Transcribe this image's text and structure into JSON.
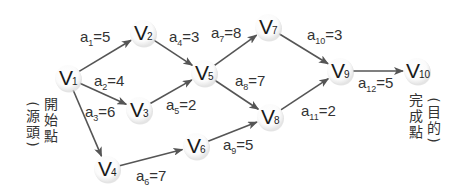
{
  "diagram": {
    "type": "activity-on-edge network (AOE)",
    "nodes": [
      {
        "id": "v1",
        "letter": "V",
        "sub": "1",
        "x": 68,
        "y": 78
      },
      {
        "id": "v2",
        "letter": "V",
        "sub": "2",
        "x": 143,
        "y": 33
      },
      {
        "id": "v3",
        "letter": "V",
        "sub": "3",
        "x": 139,
        "y": 110
      },
      {
        "id": "v4",
        "letter": "V",
        "sub": "4",
        "x": 107,
        "y": 169
      },
      {
        "id": "v5",
        "letter": "V",
        "sub": "5",
        "x": 204,
        "y": 73
      },
      {
        "id": "v6",
        "letter": "V",
        "sub": "6",
        "x": 196,
        "y": 146
      },
      {
        "id": "v7",
        "letter": "V",
        "sub": "7",
        "x": 268,
        "y": 27
      },
      {
        "id": "v8",
        "letter": "V",
        "sub": "8",
        "x": 270,
        "y": 117
      },
      {
        "id": "v9",
        "letter": "V",
        "sub": "9",
        "x": 340,
        "y": 71
      },
      {
        "id": "v10",
        "letter": "V",
        "sub": "10",
        "x": 417,
        "y": 71
      }
    ],
    "edges": [
      {
        "id": "a1",
        "from": "v1",
        "to": "v2",
        "name": "a",
        "sub": "1",
        "value": "=5",
        "lx": 80,
        "ly": 42
      },
      {
        "id": "a2",
        "from": "v1",
        "to": "v3",
        "name": "a",
        "sub": "2",
        "value": "=4",
        "lx": 94,
        "ly": 86
      },
      {
        "id": "a3",
        "from": "v1",
        "to": "v4",
        "name": "a",
        "sub": "3",
        "value": "=6",
        "lx": 85,
        "ly": 117
      },
      {
        "id": "a4",
        "from": "v2",
        "to": "v5",
        "name": "a",
        "sub": "4",
        "value": "=3",
        "lx": 169,
        "ly": 42
      },
      {
        "id": "a5",
        "from": "v3",
        "to": "v5",
        "name": "a",
        "sub": "5",
        "value": "=2",
        "lx": 166,
        "ly": 110
      },
      {
        "id": "a6",
        "from": "v4",
        "to": "v6",
        "name": "a",
        "sub": "6",
        "value": "=7",
        "lx": 136,
        "ly": 181
      },
      {
        "id": "a7",
        "from": "v5",
        "to": "v7",
        "name": "a",
        "sub": "7",
        "value": "=8",
        "lx": 211,
        "ly": 38
      },
      {
        "id": "a8",
        "from": "v5",
        "to": "v8",
        "name": "a",
        "sub": "8",
        "value": "=7",
        "lx": 235,
        "ly": 86
      },
      {
        "id": "a9",
        "from": "v6",
        "to": "v8",
        "name": "a",
        "sub": "9",
        "value": "=5",
        "lx": 223,
        "ly": 150
      },
      {
        "id": "a10",
        "from": "v7",
        "to": "v9",
        "name": "a",
        "sub": "10",
        "value": "=3",
        "lx": 307,
        "ly": 40
      },
      {
        "id": "a11",
        "from": "v8",
        "to": "v9",
        "name": "a",
        "sub": "11",
        "value": "=2",
        "lx": 301,
        "ly": 116
      },
      {
        "id": "a12",
        "from": "v9",
        "to": "v10",
        "name": "a",
        "sub": "12",
        "value": "=5",
        "lx": 358,
        "ly": 88
      }
    ]
  },
  "annotations": {
    "source": {
      "main": [
        "開",
        "始",
        "點"
      ],
      "paren": [
        "源",
        "頭"
      ]
    },
    "sink": {
      "main": [
        "完",
        "成",
        "點"
      ],
      "paren": [
        "目",
        "的"
      ]
    }
  },
  "colors": {
    "arrow": "#555555",
    "node_fill": "#ffffff",
    "node_shadow": "#d8d8d8",
    "text": "#222222"
  }
}
